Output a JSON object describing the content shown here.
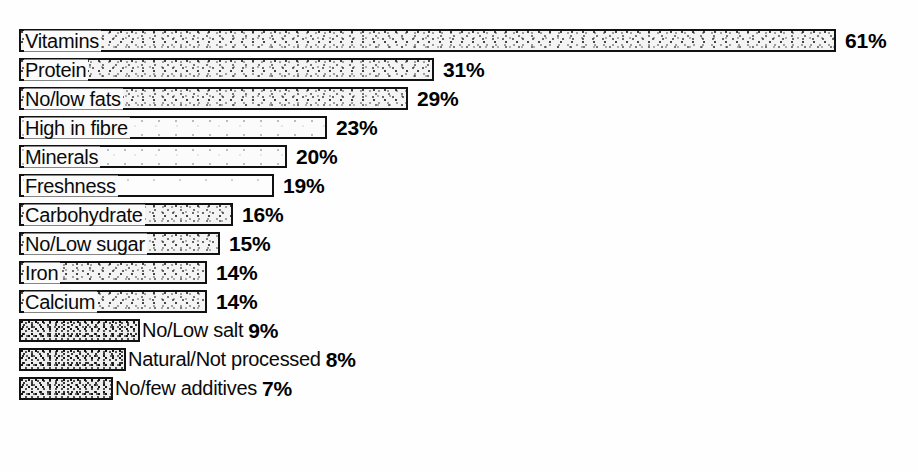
{
  "chart_data": {
    "type": "bar",
    "orientation": "horizontal",
    "title": "",
    "subtitle": "",
    "xlabel": "",
    "ylabel": "",
    "xlim": [
      0,
      61
    ],
    "grid": false,
    "legend": false,
    "value_suffix": "%",
    "categories": [
      "Vitamins",
      "Protein",
      "No/low fats",
      "High in fibre",
      "Minerals",
      "Freshness",
      "Carbohydrate",
      "No/Low sugar",
      "Iron",
      "Calcium",
      "No/Low salt",
      "Natural/Not processed",
      "No/few additives"
    ],
    "values": [
      61,
      31,
      29,
      23,
      20,
      19,
      16,
      15,
      14,
      14,
      9,
      8,
      7
    ],
    "value_labels": [
      "61%",
      "31%",
      "29%",
      "23%",
      "20%",
      "19%",
      "16%",
      "15%",
      "14%",
      "14%",
      "9%",
      "8%",
      "7%"
    ]
  },
  "rows": [
    {
      "label": "Vitamins",
      "value": 61,
      "value_label": "61%",
      "label_inside": true,
      "fill": "normal"
    },
    {
      "label": "Protein",
      "value": 31,
      "value_label": "31%",
      "label_inside": true,
      "fill": "normal"
    },
    {
      "label": "No/low fats",
      "value": 29,
      "value_label": "29%",
      "label_inside": true,
      "fill": "normal"
    },
    {
      "label": "High in fibre",
      "value": 23,
      "value_label": "23%",
      "label_inside": true,
      "fill": "faded"
    },
    {
      "label": "Minerals",
      "value": 20,
      "value_label": "20%",
      "label_inside": true,
      "fill": "faded"
    },
    {
      "label": "Freshness",
      "value": 19,
      "value_label": "19%",
      "label_inside": true,
      "fill": "very-faded"
    },
    {
      "label": "Carbohydrate",
      "value": 16,
      "value_label": "16%",
      "label_inside": true,
      "fill": "normal"
    },
    {
      "label": "No/Low sugar",
      "value": 15,
      "value_label": "15%",
      "label_inside": true,
      "fill": "normal"
    },
    {
      "label": "Iron",
      "value": 14,
      "value_label": "14%",
      "label_inside": true,
      "fill": "normal"
    },
    {
      "label": "Calcium",
      "value": 14,
      "value_label": "14%",
      "label_inside": true,
      "fill": "normal"
    },
    {
      "label": "No/Low salt",
      "value": 9,
      "value_label": "9%",
      "label_inside": false,
      "fill": "dense"
    },
    {
      "label": "Natural/Not processed",
      "value": 8,
      "value_label": "8%",
      "label_inside": false,
      "fill": "dense"
    },
    {
      "label": "No/few additives",
      "value": 7,
      "value_label": "7%",
      "label_inside": false,
      "fill": "dense"
    }
  ],
  "colors": {
    "background": "#ffffff",
    "bar_outline": "#111111",
    "bar_fill": "#f0f0f0",
    "text": "#0a0a0a"
  },
  "geometry": {
    "bar_origin_x": 19,
    "first_row_y": 26,
    "row_pitch": 29,
    "px_per_percent": 13.4
  }
}
